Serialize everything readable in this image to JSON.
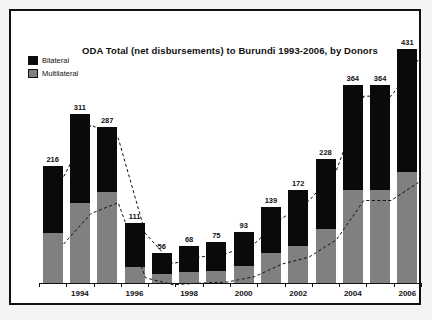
{
  "chart_data": {
    "type": "bar",
    "subtype": "stacked-bar-with-trend-lines",
    "title": "ODA Total (net disbursements) to Burundi 1993-2006, by Donors",
    "xlabel": "",
    "ylabel": "",
    "categories": [
      "1993",
      "1994",
      "1995",
      "1996",
      "1997",
      "1998",
      "1999",
      "2000",
      "2001",
      "2002",
      "2003",
      "2004",
      "2005",
      "2006"
    ],
    "xtick_labels": [
      "1994",
      "1996",
      "1998",
      "2000",
      "2002",
      "2004",
      "2006"
    ],
    "xtick_categories": [
      "1994",
      "1996",
      "1998",
      "2000",
      "2002",
      "2004",
      "2006"
    ],
    "ylim": [
      0,
      460
    ],
    "grid": false,
    "legend_position": "top-left",
    "data_labels": [
      "216",
      "311",
      "287",
      "111",
      "56",
      "68",
      "75",
      "93",
      "139",
      "172",
      "228",
      "364",
      "364",
      "431"
    ],
    "totals": [
      216,
      311,
      287,
      111,
      56,
      68,
      75,
      93,
      139,
      172,
      228,
      364,
      364,
      431
    ],
    "series": [
      {
        "name": "Multilateral",
        "color": "#808080",
        "values": [
          92,
          148,
          168,
          30,
          17,
          20,
          22,
          32,
          55,
          68,
          100,
          172,
          172,
          205
        ]
      },
      {
        "name": "Bilateral",
        "color": "#0a0a0a",
        "values": [
          124,
          163,
          119,
          81,
          39,
          48,
          53,
          61,
          84,
          104,
          128,
          192,
          192,
          226
        ]
      }
    ],
    "trend_lines": [
      {
        "name": "total-trend",
        "style": "dashed",
        "values": [
          216,
          311,
          287,
          111,
          56,
          68,
          75,
          93,
          139,
          172,
          228,
          364,
          364,
          431
        ]
      },
      {
        "name": "multilateral-trend",
        "style": "dashed",
        "values": [
          92,
          148,
          168,
          30,
          17,
          20,
          22,
          32,
          55,
          68,
          100,
          172,
          172,
          205
        ]
      }
    ]
  },
  "legend": {
    "items": [
      {
        "label": "Bilateral",
        "color": "#0a0a0a"
      },
      {
        "label": "Multilateral",
        "color": "#808080"
      }
    ]
  }
}
